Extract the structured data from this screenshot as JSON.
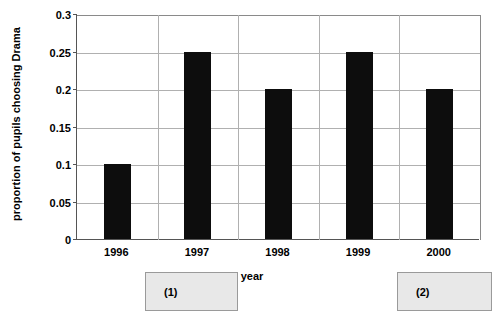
{
  "chart_data": {
    "type": "bar",
    "title": "",
    "categories": [
      "1996",
      "1997",
      "1998",
      "1999",
      "2000"
    ],
    "values": [
      0.1,
      0.25,
      0.2,
      0.25,
      0.2
    ],
    "series": [
      {
        "name": "proportion of pupils choosing Drama",
        "values": [
          0.1,
          0.25,
          0.2,
          0.25,
          0.2
        ]
      }
    ],
    "xlabel": "year",
    "ylabel": "proportion of pupils choosing Drama",
    "ylim": [
      0,
      0.3
    ],
    "yticks": [
      "0",
      "0.05",
      "0.1",
      "0.15",
      "0.2",
      "0.25",
      "0.3"
    ],
    "ytick_values": [
      0,
      0.05,
      0.1,
      0.15,
      0.2,
      0.25,
      0.3
    ],
    "grid": "horizontal-and-vertical",
    "legend": "none",
    "bar_color": "#0d0d0d",
    "grid_color": "#b0b0b0",
    "axis_color": "#555555",
    "background_color": "#ffffff",
    "annotations": [
      {
        "label": "(1)",
        "under_category": "1997"
      },
      {
        "label": "(2)",
        "under_category": "2000"
      }
    ]
  }
}
